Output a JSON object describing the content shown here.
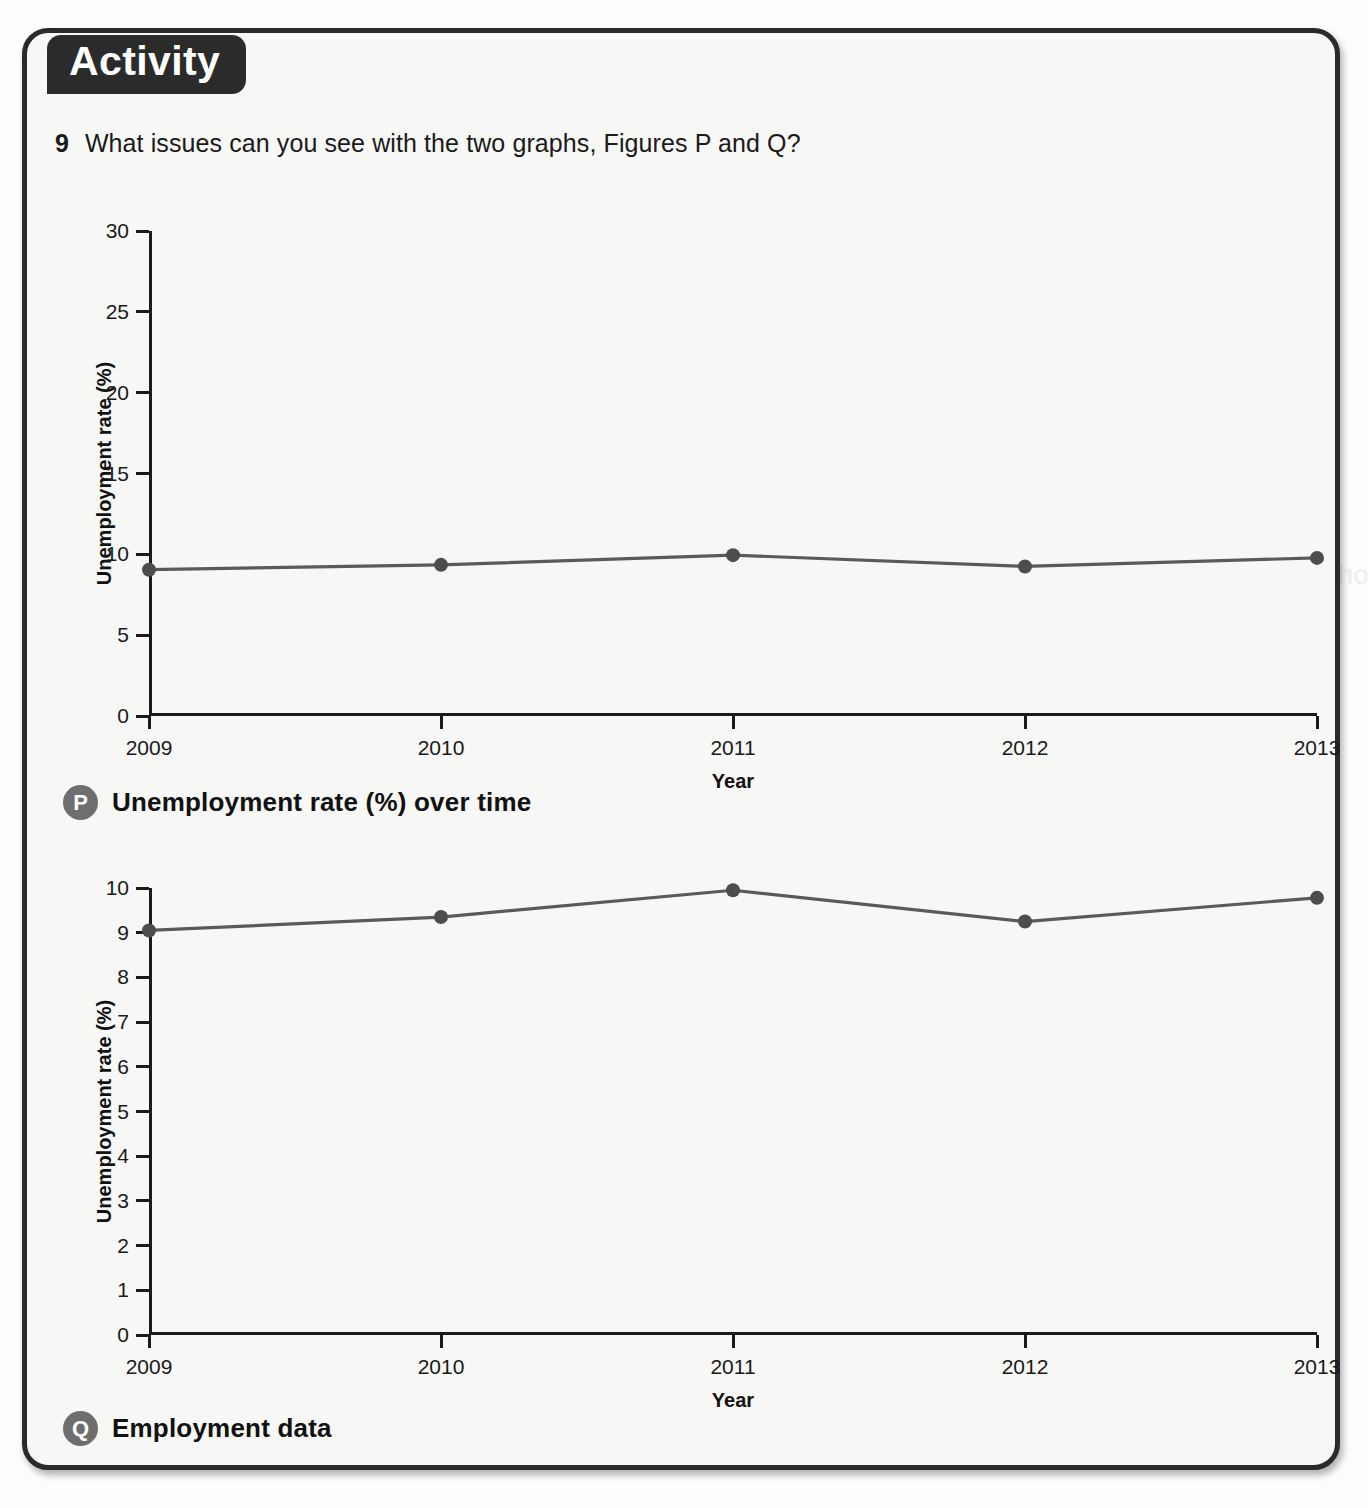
{
  "card": {
    "tab_label": "Activity"
  },
  "question": {
    "number": "9",
    "text": "What issues can you see with the two graphs, Figures P and Q?"
  },
  "figures": [
    {
      "badge": "P",
      "caption": "Unemployment rate (%) over time"
    },
    {
      "badge": "Q",
      "caption": "Employment data"
    }
  ],
  "colors": {
    "line": "#5a5a5a",
    "marker": "#4d4d4d",
    "axis": "#1a1a1a",
    "tab_background": "#2b2b2b",
    "card_background": "#f7f7f5",
    "badge_background": "#6e6e6e"
  },
  "chart_data": [
    {
      "type": "line",
      "figure": "P",
      "title": "Unemployment rate (%) over time",
      "xlabel": "Year",
      "ylabel": "Unemployment rate (%)",
      "categories": [
        "2009",
        "2010",
        "2011",
        "2012",
        "2013"
      ],
      "x": [
        2009,
        2010,
        2011,
        2012,
        2013
      ],
      "values": [
        9.05,
        9.35,
        9.95,
        9.25,
        9.78
      ],
      "ylim": [
        0,
        30
      ],
      "yticks": [
        0,
        5,
        10,
        15,
        20,
        25,
        30
      ],
      "xlim": [
        2009,
        2013
      ],
      "grid": false,
      "legend": "none",
      "markers": true
    },
    {
      "type": "line",
      "figure": "Q",
      "title": "Employment data",
      "xlabel": "Year",
      "ylabel": "Unemployment rate (%)",
      "categories": [
        "2009",
        "2010",
        "2011",
        "2012",
        "2013"
      ],
      "x": [
        2009,
        2010,
        2011,
        2012,
        2013
      ],
      "values": [
        9.05,
        9.35,
        9.95,
        9.25,
        9.78
      ],
      "ylim": [
        0,
        10
      ],
      "yticks": [
        0,
        1,
        2,
        3,
        4,
        5,
        6,
        7,
        8,
        9,
        10
      ],
      "xlim": [
        2009,
        2013
      ],
      "grid": false,
      "legend": "none",
      "markers": true
    }
  ]
}
